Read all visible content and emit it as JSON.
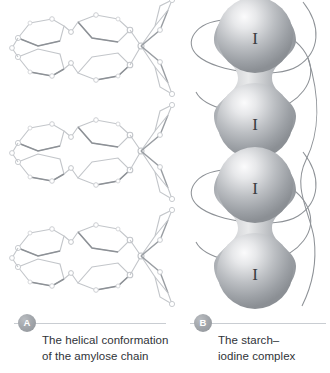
{
  "figure": {
    "background_color": "#ffffff",
    "panels": [
      {
        "key": "a",
        "badge_label": "A",
        "caption_line1": "The helical conformation",
        "caption_line2": "of the amylose chain",
        "art": {
          "kind": "amylose-helix-line-drawing",
          "repeat_units": 3,
          "ring_stroke_color": "#b9bcc0",
          "ring_shadow_color": "#8b8f94",
          "atom_node_color": "#d8dadd"
        }
      },
      {
        "key": "b",
        "badge_label": "B",
        "caption_line1": "The starch–",
        "caption_line2": "iodine complex",
        "art": {
          "kind": "starch-iodine-dumbbell",
          "dumbbell_count": 2,
          "spheres_per_dumbbell": 2,
          "sphere_label": "I",
          "sphere_base_color": "#9a9ea3",
          "sphere_highlight_color": "#f2f3f4",
          "helix_stroke_color": "#8e9297",
          "helix_turns": 4
        }
      }
    ],
    "rule_color": "#c9cdd2",
    "badge_text_color": "#ffffff",
    "caption_text_color": "#2f3338"
  }
}
